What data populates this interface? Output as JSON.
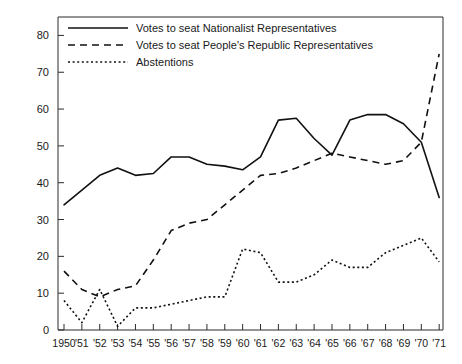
{
  "chart_data": {
    "type": "line",
    "title": "",
    "subtitle": "",
    "xlabel": "",
    "ylabel": "",
    "xlim": [
      1950,
      1971
    ],
    "ylim": [
      0,
      85
    ],
    "yticks": [
      0,
      10,
      20,
      30,
      40,
      50,
      60,
      70,
      80
    ],
    "grid": false,
    "legend_position": "top-left",
    "x": [
      1950,
      1951,
      1952,
      1953,
      1954,
      1955,
      1956,
      1957,
      1958,
      1959,
      1960,
      1961,
      1962,
      1963,
      1964,
      1965,
      1966,
      1967,
      1968,
      1969,
      1970,
      1971
    ],
    "categories": [
      "1950",
      "'51",
      "'52",
      "'53",
      "'54",
      "'55",
      "'56",
      "'57",
      "'58",
      "'59",
      "'60",
      "'61",
      "'62",
      "'63",
      "'64",
      "'65",
      "'66",
      "'67",
      "'68",
      "'69",
      "'70",
      "'71"
    ],
    "series": [
      {
        "name": "Votes to seat Nationalist Representatives",
        "style": "solid",
        "values": [
          34,
          38,
          42,
          44,
          42,
          42.5,
          47,
          47,
          45,
          44.5,
          43.5,
          47,
          57,
          57.5,
          52,
          47.5,
          57,
          58.5,
          58.5,
          56,
          51,
          36
        ]
      },
      {
        "name": "Votes to seat People's Republic Representatives",
        "style": "dashed",
        "values": [
          16,
          11,
          9,
          11,
          12,
          19,
          27,
          29,
          30,
          34,
          38,
          42,
          42.5,
          44,
          46,
          48,
          47,
          46,
          45,
          46,
          51,
          75
        ]
      },
      {
        "name": "Abstentions",
        "style": "dotted",
        "values": [
          8,
          2,
          11,
          1,
          6,
          6,
          7,
          8,
          9,
          9,
          22,
          21,
          13,
          13,
          15,
          19,
          17,
          17,
          21,
          23,
          25,
          18.5
        ]
      }
    ],
    "legend": [
      "Votes to seat Nationalist Representatives",
      "Votes to seat People's Republic Representatives",
      "Abstentions"
    ],
    "colors": {
      "line": "#111111",
      "axis": "#2b2b2b",
      "background": "#ffffff"
    }
  }
}
